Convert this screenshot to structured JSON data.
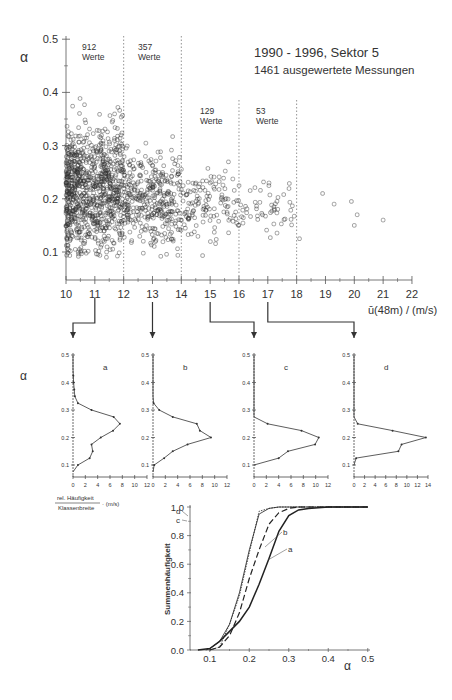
{
  "chart_data": [
    {
      "type": "scatter",
      "title": "1990 - 1996, Sektor 5",
      "subtitle": "1461 ausgewertete Messungen",
      "xlabel": "ū(48m) / (m/s)",
      "ylabel": "α",
      "xlim": [
        10,
        22
      ],
      "ylim": [
        0.05,
        0.5
      ],
      "xticks": [
        "10",
        "11",
        "12",
        "13",
        "14",
        "15",
        "16",
        "17",
        "18",
        "19",
        "20",
        "21",
        "22"
      ],
      "yticks": [
        "0.1",
        "0.2",
        "0.3",
        "0.4",
        "0.5"
      ],
      "bin_dividers": [
        12,
        14,
        16,
        18
      ],
      "annotations": [
        {
          "count": "912",
          "label": "Werte",
          "x_range": [
            10,
            12
          ]
        },
        {
          "count": "357",
          "label": "Werte",
          "x_range": [
            12,
            14
          ]
        },
        {
          "count": "129",
          "label": "Werte",
          "x_range": [
            14,
            16
          ]
        },
        {
          "count": "53",
          "label": "Werte",
          "x_range": [
            16,
            18
          ]
        }
      ],
      "total_points": 1461,
      "sample_points_far_right": [
        [
          18.9,
          0.21
        ],
        [
          19.3,
          0.19
        ],
        [
          19.9,
          0.195
        ],
        [
          20.1,
          0.17
        ],
        [
          20.0,
          0.15
        ],
        [
          21.0,
          0.16
        ],
        [
          18.1,
          0.125
        ]
      ],
      "density_summary": "dense cloud for u 10-13 with alpha 0.1-0.35, thinning and narrowing toward alpha 0.15-0.25 as u increases"
    },
    {
      "type": "line",
      "title": "a",
      "xlabel": "rel. Häufigkeit / Klassenbreite · (m/s)",
      "ylabel": "α",
      "xlim": [
        0,
        12
      ],
      "ylim": [
        0.05,
        0.5
      ],
      "xticks": [
        "0",
        "2",
        "4",
        "6",
        "8",
        "10",
        "12"
      ],
      "yticks": [
        "0.1",
        "0.2",
        "0.3",
        "0.4",
        "0.5"
      ],
      "alpha": [
        0.075,
        0.1,
        0.125,
        0.15,
        0.175,
        0.2,
        0.225,
        0.25,
        0.275,
        0.3,
        0.325,
        0.35,
        0.375,
        0.4,
        0.425,
        0.45,
        0.5
      ],
      "values": [
        0,
        0.8,
        2.7,
        3.2,
        3.0,
        4.5,
        6.5,
        7.6,
        6.6,
        3.0,
        0.8,
        0.3,
        0.2,
        0.1,
        0.05,
        0,
        0
      ]
    },
    {
      "type": "line",
      "title": "b",
      "xlim": [
        0,
        12
      ],
      "ylim": [
        0.05,
        0.5
      ],
      "xticks": [
        "0",
        "2",
        "4",
        "6",
        "8",
        "10",
        "12"
      ],
      "yticks": [
        "0.1",
        "0.2",
        "0.3",
        "0.4",
        "0.5"
      ],
      "alpha": [
        0.075,
        0.1,
        0.125,
        0.15,
        0.175,
        0.2,
        0.225,
        0.25,
        0.275,
        0.3,
        0.325,
        0.35,
        0.4,
        0.45,
        0.5
      ],
      "values": [
        0,
        0.2,
        1.8,
        3.2,
        5.6,
        9.4,
        7.6,
        7.1,
        3.2,
        1.0,
        0.1,
        0,
        0,
        0,
        0
      ]
    },
    {
      "type": "line",
      "title": "c",
      "xlim": [
        0,
        12
      ],
      "ylim": [
        0.05,
        0.5
      ],
      "xticks": [
        "0",
        "2",
        "4",
        "6",
        "8",
        "10",
        "12"
      ],
      "yticks": [
        "0.1",
        "0.2",
        "0.3",
        "0.4",
        "0.5"
      ],
      "alpha": [
        0.1,
        0.125,
        0.15,
        0.175,
        0.2,
        0.225,
        0.25,
        0.275,
        0.3,
        0.4,
        0.5
      ],
      "values": [
        0,
        4.0,
        5.5,
        9.9,
        10.5,
        7.7,
        2.2,
        0,
        0,
        0,
        0
      ]
    },
    {
      "type": "line",
      "title": "d",
      "xlim": [
        0,
        14
      ],
      "ylim": [
        0.05,
        0.5
      ],
      "xticks": [
        "0",
        "2",
        "4",
        "6",
        "8",
        "10",
        "12",
        "14"
      ],
      "yticks": [
        "0.1",
        "0.2",
        "0.3",
        "0.4",
        "0.5"
      ],
      "alpha": [
        0.1,
        0.125,
        0.15,
        0.175,
        0.2,
        0.225,
        0.25,
        0.275,
        0.3,
        0.4,
        0.5
      ],
      "values": [
        0,
        0.4,
        8.4,
        9.0,
        13.6,
        7.3,
        0.7,
        0,
        0,
        0,
        0
      ]
    },
    {
      "type": "line",
      "title": "",
      "xlabel": "α",
      "ylabel": "Summenhäufigkeit",
      "xlim": [
        0.05,
        0.5
      ],
      "ylim": [
        0,
        1.0
      ],
      "xticks": [
        "0.1",
        "0.2",
        "0.3",
        "0.4",
        "0.5"
      ],
      "yticks": [
        "0.0",
        "0.2",
        "0.4",
        "0.6",
        "0.8",
        "1.0"
      ],
      "series": [
        {
          "name": "a",
          "style": "solid-thick",
          "x": [
            0.07,
            0.1,
            0.125,
            0.15,
            0.175,
            0.2,
            0.225,
            0.25,
            0.275,
            0.3,
            0.325,
            0.35,
            0.4,
            0.5
          ],
          "y": [
            0,
            0.01,
            0.06,
            0.13,
            0.2,
            0.3,
            0.46,
            0.64,
            0.83,
            0.94,
            0.98,
            0.99,
            1.0,
            1.0
          ]
        },
        {
          "name": "b",
          "style": "dashed",
          "x": [
            0.1,
            0.125,
            0.15,
            0.175,
            0.2,
            0.225,
            0.25,
            0.275,
            0.3,
            0.325,
            0.35,
            0.4,
            0.5
          ],
          "y": [
            0,
            0.02,
            0.1,
            0.26,
            0.5,
            0.7,
            0.88,
            0.96,
            0.99,
            1.0,
            1.0,
            1.0,
            1.0
          ]
        },
        {
          "name": "c",
          "style": "solid-thin",
          "x": [
            0.09,
            0.1,
            0.125,
            0.15,
            0.175,
            0.2,
            0.225,
            0.25,
            0.275,
            0.3,
            0.5
          ],
          "y": [
            0,
            0.01,
            0.06,
            0.18,
            0.4,
            0.7,
            0.95,
            0.99,
            1.0,
            1.0,
            1.0
          ]
        },
        {
          "name": "d",
          "style": "dotted",
          "x": [
            0.1,
            0.125,
            0.15,
            0.175,
            0.2,
            0.225,
            0.25,
            0.275,
            0.3,
            0.5
          ],
          "y": [
            0,
            0.02,
            0.18,
            0.38,
            0.68,
            0.97,
            0.99,
            1.0,
            1.0,
            1.0
          ]
        }
      ],
      "curve_labels": [
        "a",
        "b",
        "c",
        "d"
      ]
    }
  ],
  "labels": {
    "main_title": "1990 - 1996, Sektor 5",
    "main_subtitle": "1461 ausgewertete Messungen",
    "alpha": "α",
    "x_axis_label": "ū(48m) / (m/s)",
    "hist_x_num": "rel. Häufigkeit",
    "hist_x_den": "Klassenbreite",
    "hist_x_unit": "· (m/s)",
    "cdf_ylabel": "Summenhäufigkeit",
    "bins": [
      {
        "count": "912",
        "label": "Werte"
      },
      {
        "count": "357",
        "label": "Werte"
      },
      {
        "count": "129",
        "label": "Werte"
      },
      {
        "count": "53",
        "label": "Werte"
      }
    ],
    "panels": [
      "a",
      "b",
      "c",
      "d"
    ]
  }
}
